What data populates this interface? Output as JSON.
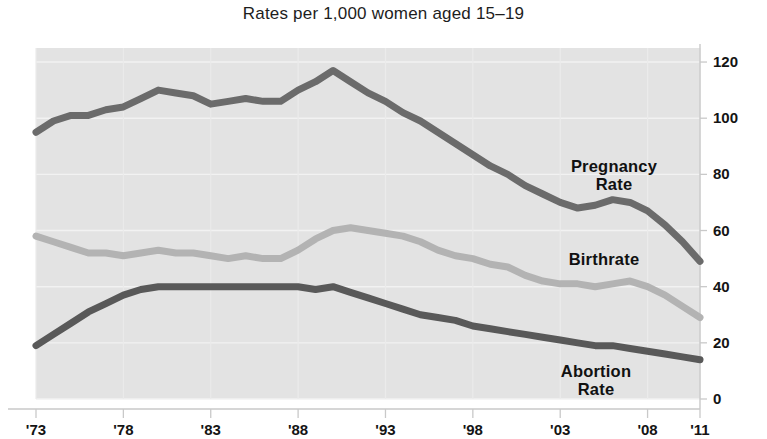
{
  "chart_data": {
    "type": "line",
    "title": "Rates per 1,000 women aged 15–19",
    "xlabel": "",
    "ylabel": "",
    "xlim": [
      1973,
      2011
    ],
    "ylim": [
      0,
      125
    ],
    "grid": true,
    "legend_position": "inline-right",
    "plot_background": "#e3e3e3",
    "x": [
      1973,
      1974,
      1975,
      1976,
      1977,
      1978,
      1979,
      1980,
      1981,
      1982,
      1983,
      1984,
      1985,
      1986,
      1987,
      1988,
      1989,
      1990,
      1991,
      1992,
      1993,
      1994,
      1995,
      1996,
      1997,
      1998,
      1999,
      2000,
      2001,
      2002,
      2003,
      2004,
      2005,
      2006,
      2007,
      2008,
      2009,
      2010,
      2011
    ],
    "xticks": [
      1973,
      1978,
      1983,
      1988,
      1993,
      1998,
      2003,
      2008,
      2011
    ],
    "xtick_labels": [
      "'73",
      "'78",
      "'83",
      "'88",
      "'93",
      "'98",
      "'03",
      "'08",
      "'11"
    ],
    "yticks": [
      0,
      20,
      40,
      60,
      80,
      100,
      120
    ],
    "ytick_labels": [
      "0",
      "20",
      "40",
      "60",
      "80",
      "100",
      "120"
    ],
    "series": [
      {
        "name": "Pregnancy Rate",
        "label": "Pregnancy\nRate",
        "color": "#6b6b6b",
        "linewidth": 7,
        "values": [
          95,
          99,
          101,
          101,
          103,
          104,
          107,
          110,
          109,
          108,
          105,
          106,
          107,
          106,
          106,
          110,
          113,
          117,
          113,
          109,
          106,
          102,
          99,
          95,
          91,
          87,
          83,
          80,
          76,
          73,
          70,
          68,
          69,
          71,
          70,
          67,
          62,
          56,
          49
        ]
      },
      {
        "name": "Birthrate",
        "label": "Birthrate",
        "color": "#b3b3b3",
        "linewidth": 7,
        "values": [
          58,
          56,
          54,
          52,
          52,
          51,
          52,
          53,
          52,
          52,
          51,
          50,
          51,
          50,
          50,
          53,
          57,
          60,
          61,
          60,
          59,
          58,
          56,
          53,
          51,
          50,
          48,
          47,
          44,
          42,
          41,
          41,
          40,
          41,
          42,
          40,
          37,
          33,
          29
        ]
      },
      {
        "name": "Abortion Rate",
        "label": "Abortion\nRate",
        "color": "#595959",
        "linewidth": 7,
        "values": [
          19,
          23,
          27,
          31,
          34,
          37,
          39,
          40,
          40,
          40,
          40,
          40,
          40,
          40,
          40,
          40,
          39,
          40,
          38,
          36,
          34,
          32,
          30,
          29,
          28,
          26,
          25,
          24,
          23,
          22,
          21,
          20,
          19,
          19,
          18,
          17,
          16,
          15,
          14
        ]
      }
    ],
    "annotations": [
      {
        "text": "Pregnancy\nRate",
        "series": "Pregnancy Rate",
        "x_px": 614,
        "y_px": 175
      },
      {
        "text": "Birthrate",
        "series": "Birthrate",
        "x_px": 604,
        "y_px": 268
      },
      {
        "text": "Abortion\nRate",
        "series": "Abortion Rate",
        "x_px": 596,
        "y_px": 380
      }
    ]
  }
}
